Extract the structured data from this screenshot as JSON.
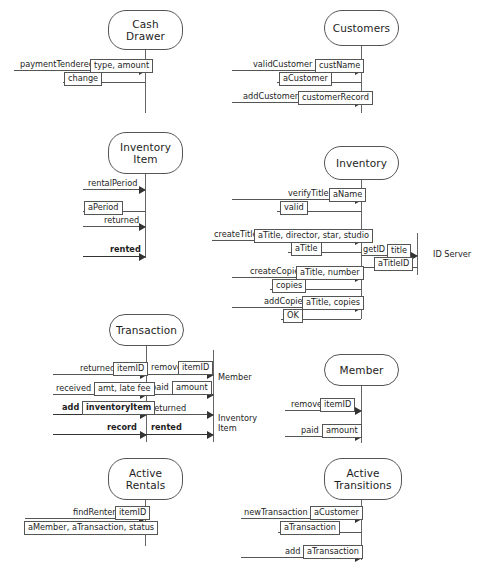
{
  "diagram": {
    "type": "uml-sequence-collaboration",
    "line_color": "#555555",
    "text_color": "#1d1d1d",
    "background": "#ffffff"
  },
  "objects": {
    "cash_drawer": "Cash\nDrawer",
    "customers": "Customers",
    "inventory_item": "Inventory\nItem",
    "inventory": "Inventory",
    "transaction": "Transaction",
    "member": "Member",
    "active_rentals": "Active\nRentals",
    "active_transitions": "Active\nTransitions"
  },
  "captions": {
    "id_server": "ID Server",
    "member_target": "Member",
    "inventory_item_target": "Inventory\nItem"
  },
  "panels": [
    {
      "id": "cash-drawer",
      "object": "Cash Drawer",
      "messages": [
        {
          "name": "paymentTendered",
          "params": "type, amount",
          "bold": false,
          "direction": "right"
        },
        {
          "name": "",
          "params": "change",
          "bold": false,
          "direction": "return"
        }
      ]
    },
    {
      "id": "customers",
      "object": "Customers",
      "messages": [
        {
          "name": "validCustomer",
          "params": "custName",
          "bold": false,
          "direction": "right"
        },
        {
          "name": "",
          "params": "aCustomer",
          "bold": false,
          "direction": "return"
        },
        {
          "name": "addCustomer",
          "params": "customerRecord",
          "bold": false,
          "direction": "right"
        }
      ]
    },
    {
      "id": "inventory-item",
      "object": "Inventory Item",
      "messages": [
        {
          "name": "rentalPeriod",
          "params": "",
          "bold": false,
          "direction": "right"
        },
        {
          "name": "",
          "params": "aPeriod",
          "bold": false,
          "direction": "return"
        },
        {
          "name": "returned",
          "params": "",
          "bold": false,
          "direction": "right"
        },
        {
          "name": "rented",
          "params": "",
          "bold": true,
          "direction": "right"
        }
      ]
    },
    {
      "id": "inventory",
      "object": "Inventory",
      "messages": [
        {
          "name": "verifyTitle",
          "params": "aName",
          "bold": false,
          "direction": "right"
        },
        {
          "name": "",
          "params": "valid",
          "bold": false,
          "direction": "return"
        },
        {
          "name": "createTitle",
          "params": "aTitle, director, star, studio",
          "bold": false,
          "direction": "right"
        },
        {
          "name": "",
          "params": "aTitle",
          "bold": false,
          "direction": "return"
        },
        {
          "name": "createCopies",
          "params": "aTitle, number",
          "bold": false,
          "direction": "right"
        },
        {
          "name": "",
          "params": "copies",
          "bold": false,
          "direction": "return"
        },
        {
          "name": "addCopies",
          "params": "aTitle, copies",
          "bold": false,
          "direction": "right"
        },
        {
          "name": "",
          "params": "OK",
          "bold": false,
          "direction": "return"
        }
      ],
      "outgoing": [
        {
          "name": "getID",
          "params": "title",
          "target": "ID Server",
          "bold": false
        },
        {
          "name": "",
          "params": "aTitleID",
          "target": "ID Server",
          "bold": false,
          "direction": "return"
        }
      ]
    },
    {
      "id": "transaction",
      "object": "Transaction",
      "messages": [
        {
          "name": "returned",
          "params": "itemID",
          "bold": false,
          "direction": "right"
        },
        {
          "name": "received",
          "params": "amt, late fee",
          "bold": false,
          "direction": "right"
        },
        {
          "name": "add",
          "params": "inventoryItem",
          "bold": true,
          "direction": "right"
        },
        {
          "name": "record",
          "params": "",
          "bold": true,
          "direction": "right"
        }
      ],
      "outgoing": [
        {
          "name": "remove",
          "params": "itemID",
          "target": "Member",
          "bold": false
        },
        {
          "name": "paid",
          "params": "amount",
          "target": "Member",
          "bold": false
        },
        {
          "name": "returned",
          "params": "",
          "target": "Inventory Item",
          "bold": false
        },
        {
          "name": "rented",
          "params": "",
          "target": "Inventory Item",
          "bold": true
        }
      ]
    },
    {
      "id": "member",
      "object": "Member",
      "messages": [
        {
          "name": "remove",
          "params": "itemID",
          "bold": false,
          "direction": "right"
        },
        {
          "name": "paid",
          "params": "amount",
          "bold": false,
          "direction": "right"
        }
      ]
    },
    {
      "id": "active-rentals",
      "object": "Active Rentals",
      "messages": [
        {
          "name": "findRenter",
          "params": "itemID",
          "bold": false,
          "direction": "right"
        },
        {
          "name": "",
          "params": "aMember, aTransaction, status",
          "bold": false,
          "direction": "return"
        }
      ]
    },
    {
      "id": "active-transitions",
      "object": "Active Transitions",
      "messages": [
        {
          "name": "newTransaction",
          "params": "aCustomer",
          "bold": false,
          "direction": "right"
        },
        {
          "name": "",
          "params": "aTransaction",
          "bold": false,
          "direction": "return"
        },
        {
          "name": "add",
          "params": "aTransaction",
          "bold": false,
          "direction": "right"
        }
      ]
    }
  ],
  "labels": {
    "payment_tendered": "paymentTendered",
    "change": "change",
    "type_amount": "type, amount",
    "valid_customer": "validCustomer",
    "cust_name": "custName",
    "a_customer": "aCustomer",
    "add_customer": "addCustomer",
    "customer_record": "customerRecord",
    "rental_period": "rentalPeriod",
    "a_period": "aPeriod",
    "returned": "returned",
    "rented": "rented",
    "verify_title": "verifyTitle",
    "a_name": "aName",
    "valid": "valid",
    "create_title": "createTitle",
    "title_params": "aTitle, director, star, studio",
    "a_title": "aTitle",
    "get_id": "getID",
    "title": "title",
    "a_title_id": "aTitleID",
    "create_copies": "createCopies",
    "copies_params": "aTitle, number",
    "copies": "copies",
    "add_copies": "addCopies",
    "add_copies_params": "aTitle, copies",
    "ok": "OK",
    "remove": "remove",
    "item_id": "itemID",
    "received": "received",
    "amt_late_fee": "amt, late fee",
    "paid": "paid",
    "amount": "amount",
    "add": "add",
    "inventory_item_param": "inventoryItem",
    "record": "record",
    "find_renter": "findRenter",
    "renter_result": "aMember, aTransaction, status",
    "new_transaction": "newTransaction",
    "a_transaction": "aTransaction"
  }
}
